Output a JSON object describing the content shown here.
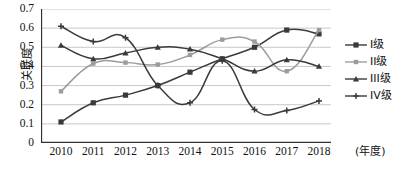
{
  "chart_data": {
    "type": "line",
    "title": "",
    "xlabel": "年度",
    "ylabel": "关联度",
    "categories": [
      "2010",
      "2011",
      "2012",
      "2013",
      "2014",
      "2015",
      "2016",
      "2017",
      "2018"
    ],
    "x": [
      2010,
      2011,
      2012,
      2013,
      2014,
      2015,
      2016,
      2017,
      2018
    ],
    "ylim": [
      0,
      0.7
    ],
    "yticks": [
      "0.7",
      "0.6",
      "0.5",
      "0.4",
      "0.3",
      "0.2",
      "0.1",
      "0"
    ],
    "ytick_values": [
      0.7,
      0.6,
      0.5,
      0.4,
      0.3,
      0.2,
      0.1,
      0
    ],
    "grid": true,
    "legend_position": "right",
    "series": [
      {
        "name": "I级",
        "marker": "square",
        "color": "#3a3a3a",
        "values": [
          0.11,
          0.21,
          0.25,
          0.3,
          0.37,
          0.44,
          0.5,
          0.59,
          0.57
        ]
      },
      {
        "name": "II级",
        "marker": "square-small",
        "color": "#9c9c9c",
        "values": [
          0.27,
          0.415,
          0.42,
          0.41,
          0.46,
          0.54,
          0.53,
          0.375,
          0.59
        ]
      },
      {
        "name": "III级",
        "marker": "triangle",
        "color": "#3a3a3a",
        "values": [
          0.51,
          0.44,
          0.47,
          0.5,
          0.49,
          0.44,
          0.375,
          0.435,
          0.4
        ]
      },
      {
        "name": "IV级",
        "marker": "cross",
        "color": "#3a3a3a",
        "values": [
          0.61,
          0.53,
          0.55,
          0.3,
          0.21,
          0.43,
          0.175,
          0.17,
          0.22
        ]
      }
    ]
  },
  "axis": {
    "y_label": "关联度",
    "x_unit": "(年度)",
    "y_ticks": [
      "0.7",
      "0.6",
      "0.5",
      "0.4",
      "0.3",
      "0.2",
      "0.1",
      "0"
    ],
    "x_ticks": [
      "2010",
      "2011",
      "2012",
      "2013",
      "2014",
      "2015",
      "2016",
      "2017",
      "2018"
    ]
  },
  "legend": {
    "items": [
      {
        "label": "I级"
      },
      {
        "label": "II级"
      },
      {
        "label": "III级"
      },
      {
        "label": "IV级"
      }
    ]
  },
  "colors": {
    "series_dark": "#3a3a3a",
    "series_light": "#9c9c9c",
    "grid": "#c8c8c8",
    "axis": "#333333",
    "background": "#ffffff"
  }
}
